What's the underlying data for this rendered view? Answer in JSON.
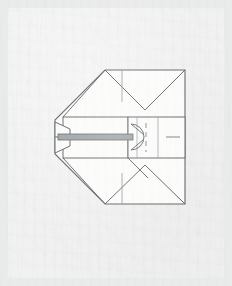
{
  "document": {
    "kind": "scanned-technical-drawing",
    "subject": "slotted flat-head screw, side view with folded construction lines",
    "title": "",
    "caption": "",
    "annotations": []
  },
  "canvas": {
    "width": 232,
    "height": 286
  },
  "paper": {
    "x": 8,
    "y": 8,
    "width": 216,
    "height": 270,
    "fill": "#f0f1f0",
    "surround": "#e9eaea"
  },
  "style": {
    "line_color": "#5b5f61",
    "line_color_light": "#8d9193",
    "hidden_line_color": "#7d8183",
    "face_fill": "#fbfbfa",
    "shank_fill": "#9aa0a2",
    "stroke_width": 1.0,
    "thin_stroke_width": 0.7
  },
  "geometry": {
    "note": "coordinates in screenshot pixel space",
    "body": {
      "name": "outer-outline",
      "points": "105,70 185,70 185,204 105,204 55,154 55,120"
    },
    "head_band_upper": {
      "x1": 63,
      "y1": 117,
      "x2": 128,
      "y2": 137
    },
    "head_band_lower": {
      "x1": 63,
      "y1": 137,
      "x2": 128,
      "y2": 158
    },
    "right_band": {
      "x1": 128,
      "y1": 117,
      "x2": 185,
      "y2": 158
    },
    "axis": {
      "x1": 55,
      "y1": 137,
      "x2": 185,
      "y2": 137
    },
    "shank": {
      "x1": 59,
      "y1": 134,
      "x2": 132,
      "y2": 140
    },
    "taper": {
      "points": "55,122 70,129 70,146 55,153"
    },
    "slot_arc": {
      "cx": 131,
      "cy": 137,
      "r": 13
    },
    "detail_dashes": {
      "x": 146,
      "y_top": 123,
      "y_bottom": 152
    },
    "center_marks": [
      {
        "x": 122,
        "y1": 70,
        "y2": 100
      },
      {
        "x": 122,
        "y1": 175,
        "y2": 204
      },
      {
        "x": 160,
        "y1": 135,
        "y2": 139
      }
    ],
    "fold_diagonals": [
      {
        "x1": 105,
        "y1": 70,
        "x2": 145,
        "y2": 110
      },
      {
        "x1": 185,
        "y1": 70,
        "x2": 145,
        "y2": 110
      },
      {
        "x1": 105,
        "y1": 204,
        "x2": 145,
        "y2": 165
      },
      {
        "x1": 185,
        "y1": 204,
        "x2": 145,
        "y2": 165
      },
      {
        "x1": 105,
        "y1": 70,
        "x2": 63,
        "y2": 117
      },
      {
        "x1": 105,
        "y1": 204,
        "x2": 63,
        "y2": 158
      },
      {
        "x1": 128,
        "y1": 158,
        "x2": 148,
        "y2": 178
      },
      {
        "x1": 128,
        "y1": 117,
        "x2": 148,
        "y2": 97
      }
    ]
  },
  "elements": {
    "outline_label": "screw-body-outline",
    "head_label": "screw-head",
    "shank_label": "screw-shank",
    "slot_label": "screw-slot",
    "detail_label": "thread-detail"
  }
}
